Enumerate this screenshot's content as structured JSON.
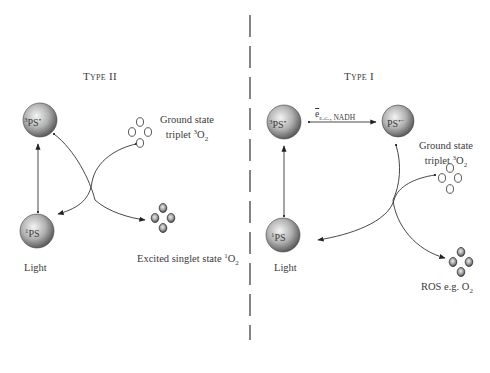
{
  "diagram": {
    "divider": {
      "style": "dashed",
      "color": "#333333"
    },
    "type2": {
      "title": "Type II",
      "excited_triplet_ps": {
        "prefix": "3",
        "label": "PS",
        "suffix": "•"
      },
      "ground_singlet_ps": {
        "prefix": "1",
        "label": "PS"
      },
      "light_label": "Light",
      "ground_state_label_line1": "Ground state",
      "ground_state_label_line2_text": "triplet ",
      "ground_state_label_sup": "3",
      "ground_state_label_species": "O",
      "ground_state_label_sub": "2",
      "excited_label_text": "Excited singlet state ",
      "excited_label_sup": "1",
      "excited_label_species": "O",
      "excited_label_sub": "2"
    },
    "type1": {
      "title": "Type I",
      "excited_triplet_ps": {
        "prefix": "3",
        "label": "PS",
        "suffix": "•"
      },
      "radical_ps": {
        "label": "PS",
        "suffix": "•−"
      },
      "ground_singlet_ps": {
        "prefix": "1",
        "label": "PS"
      },
      "light_label": "Light",
      "electron_symbol": "e",
      "electron_donor": "e.g., NADH",
      "ground_state_label_line1": "Ground state",
      "ground_state_label_line2_text": "triplet ",
      "ground_state_label_sup": "3",
      "ground_state_label_species": "O",
      "ground_state_label_sub": "2",
      "ros_label_text": "ROS e.g. O",
      "ros_label_sub": "2"
    },
    "colors": {
      "sphere_light": "#f2f2f2",
      "sphere_mid": "#a8a8a8",
      "sphere_dark": "#5a5a5a",
      "line": "#333333",
      "text": "#3a3a3a"
    }
  }
}
